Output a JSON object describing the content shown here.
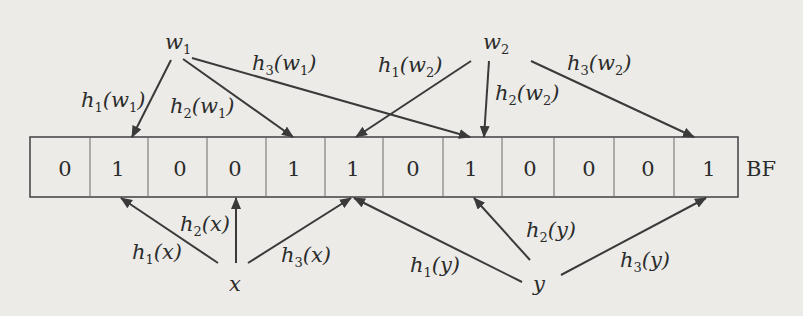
{
  "diagram": {
    "type": "bloom-filter",
    "array_label": "BF",
    "bits": [
      0,
      1,
      0,
      0,
      1,
      1,
      0,
      1,
      0,
      0,
      0,
      1
    ],
    "inserted_elements": [
      {
        "name": "w",
        "sub": "1",
        "hashes": [
          {
            "fn": "h",
            "sub": "1",
            "target": 1
          },
          {
            "fn": "h",
            "sub": "2",
            "target": 4
          },
          {
            "fn": "h",
            "sub": "3",
            "target": 7
          }
        ]
      },
      {
        "name": "w",
        "sub": "2",
        "hashes": [
          {
            "fn": "h",
            "sub": "1",
            "target": 5
          },
          {
            "fn": "h",
            "sub": "2",
            "target": 7
          },
          {
            "fn": "h",
            "sub": "3",
            "target": 11
          }
        ]
      }
    ],
    "query_elements": [
      {
        "name": "x",
        "hashes": [
          {
            "fn": "h",
            "sub": "1",
            "target": 1
          },
          {
            "fn": "h",
            "sub": "2",
            "target": 3
          },
          {
            "fn": "h",
            "sub": "3",
            "target": 5
          }
        ]
      },
      {
        "name": "y",
        "hashes": [
          {
            "fn": "h",
            "sub": "1",
            "target": 5
          },
          {
            "fn": "h",
            "sub": "2",
            "target": 7
          },
          {
            "fn": "h",
            "sub": "3",
            "target": 11
          }
        ]
      }
    ],
    "labels": {
      "w1": {
        "base": "w",
        "sub": "1"
      },
      "w2": {
        "base": "w",
        "sub": "2"
      },
      "x": "x",
      "y": "y",
      "h1_w1": {
        "pre": "h",
        "sub": "1",
        "arg": "(w",
        "argsub": "1",
        "post": ")"
      },
      "h2_w1": {
        "pre": "h",
        "sub": "2",
        "arg": "(w",
        "argsub": "1",
        "post": ")"
      },
      "h3_w1": {
        "pre": "h",
        "sub": "3",
        "arg": "(w",
        "argsub": "1",
        "post": ")"
      },
      "h1_w2": {
        "pre": "h",
        "sub": "1",
        "arg": "(w",
        "argsub": "2",
        "post": ")"
      },
      "h2_w2": {
        "pre": "h",
        "sub": "2",
        "arg": "(w",
        "argsub": "2",
        "post": ")"
      },
      "h3_w2": {
        "pre": "h",
        "sub": "3",
        "arg": "(w",
        "argsub": "2",
        "post": ")"
      },
      "h1_x": {
        "pre": "h",
        "sub": "1",
        "arg": "(x)"
      },
      "h2_x": {
        "pre": "h",
        "sub": "2",
        "arg": "(x)"
      },
      "h3_x": {
        "pre": "h",
        "sub": "3",
        "arg": "(x)"
      },
      "h1_y": {
        "pre": "h",
        "sub": "1",
        "arg": "(y)"
      },
      "h2_y": {
        "pre": "h",
        "sub": "2",
        "arg": "(y)"
      },
      "h3_y": {
        "pre": "h",
        "sub": "3",
        "arg": "(y)"
      }
    }
  }
}
